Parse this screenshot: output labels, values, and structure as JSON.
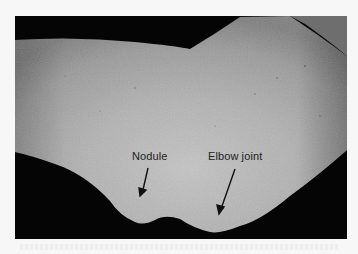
{
  "figure": {
    "background_color": "#050505",
    "skin_color_light": "#c2c2c2",
    "skin_color_mid": "#ababab",
    "skin_color_dark": "#7a7a7a",
    "page_color": "#f7f7f7"
  },
  "annotations": [
    {
      "label": "Nodule",
      "arrow_from": [
        148,
        168
      ],
      "arrow_to": [
        141,
        196
      ]
    },
    {
      "label": "Elbow joint",
      "arrow_from": [
        235,
        169
      ],
      "arrow_to": [
        219,
        214
      ]
    }
  ]
}
